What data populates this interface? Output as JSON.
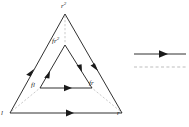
{
  "figure": {
    "name": "nested-triangle-mapping-diagram",
    "background_color": "#ffffff",
    "line_color": "#1a1a1a",
    "dashed_color": "#b0b0b0"
  },
  "outer_triangle": {
    "name": "outer-triangle",
    "vertices": [
      {
        "id": "apex",
        "label_main": "r",
        "label_sup": "2",
        "x": 65,
        "y": 13
      },
      {
        "id": "left",
        "label_main": "l",
        "label_sup": "",
        "x": 10,
        "y": 113
      },
      {
        "id": "right",
        "label_main": "r",
        "label_sup": "",
        "x": 122,
        "y": 113
      }
    ],
    "edges": [
      {
        "from": "left",
        "to": "apex",
        "arrow": "mid",
        "style": "solid"
      },
      {
        "from": "apex",
        "to": "right",
        "arrow": "mid",
        "style": "solid"
      },
      {
        "from": "left",
        "to": "right",
        "arrow": "mid",
        "style": "solid"
      }
    ]
  },
  "inner_triangle": {
    "name": "inner-triangle",
    "vertices": [
      {
        "id": "apex",
        "label_main": "fr",
        "label_sup": "2",
        "x": 65,
        "y": 47
      },
      {
        "id": "left",
        "label_main": "fl",
        "label_sup": "",
        "x": 40,
        "y": 90
      },
      {
        "id": "right",
        "label_main": "fr",
        "label_sup": "",
        "x": 90,
        "y": 90
      }
    ],
    "edges": [
      {
        "from": "left",
        "to": "apex",
        "arrow": "mid",
        "style": "solid"
      },
      {
        "from": "apex",
        "to": "right",
        "arrow": "mid",
        "style": "solid"
      },
      {
        "from": "left",
        "to": "right",
        "arrow": "mid",
        "style": "solid"
      }
    ]
  },
  "correspondence_lines": {
    "name": "dashed-correspondence-lines",
    "style": "dashed",
    "pairs": [
      {
        "from": "outer-apex",
        "to": "inner-apex"
      },
      {
        "from": "outer-left",
        "to": "inner-left"
      },
      {
        "from": "outer-right",
        "to": "inner-right"
      }
    ]
  },
  "legend": {
    "name": "legend",
    "items": [
      {
        "id": "directed-edge",
        "style": "solid-arrow",
        "color": "#1a1a1a"
      },
      {
        "id": "correspondence",
        "style": "dashed",
        "color": "#b0b0b0"
      }
    ]
  }
}
